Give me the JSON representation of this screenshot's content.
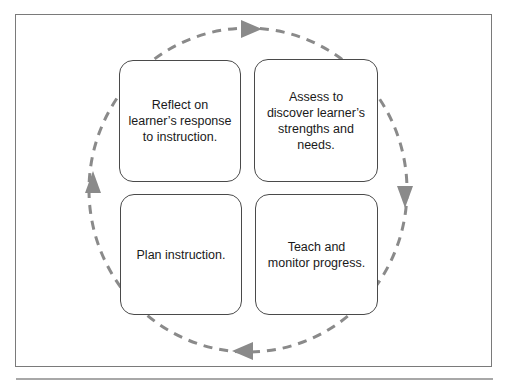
{
  "diagram": {
    "type": "cycle",
    "direction": "clockwise",
    "colors": {
      "frame": "#7a7a7a",
      "box_border": "#4a4a4a",
      "arrow": "#8a8a8a",
      "text": "#1a1a1a"
    },
    "steps": [
      {
        "id": "assess",
        "position": "top-right",
        "label": "Assess to\ndiscover learner’s\nstrengths and\nneeds."
      },
      {
        "id": "teach",
        "position": "bottom-right",
        "label": "Teach and\nmonitor progress."
      },
      {
        "id": "plan",
        "position": "bottom-left",
        "label": "Plan instruction."
      },
      {
        "id": "reflect",
        "position": "top-left",
        "label": "Reflect on\nlearner’s response\nto instruction."
      }
    ],
    "arrows": [
      {
        "position": "top",
        "points": "right"
      },
      {
        "position": "right",
        "points": "down"
      },
      {
        "position": "bottom",
        "points": "left"
      },
      {
        "position": "left",
        "points": "up"
      }
    ]
  }
}
